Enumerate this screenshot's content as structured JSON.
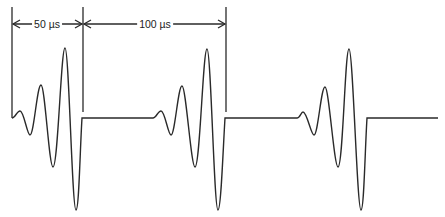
{
  "diagram": {
    "stroke_color": "#2a2a2a",
    "dimensions": [
      {
        "label": "50 µs",
        "from_x": 12,
        "to_x": 83
      },
      {
        "label": "100 µs",
        "from_x": 83,
        "to_x": 226
      }
    ],
    "markers_x": [
      12,
      83,
      226
    ],
    "baseline_y": 118,
    "bursts": [
      {
        "start_x": 12,
        "end_x": 82,
        "leading_edge": true
      },
      {
        "start_x": 153,
        "end_x": 225,
        "leading_edge": false
      },
      {
        "start_x": 297,
        "end_x": 367,
        "leading_edge": false
      }
    ]
  }
}
